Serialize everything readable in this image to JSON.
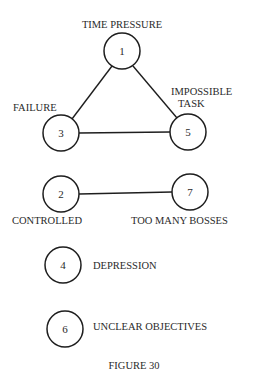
{
  "figure": {
    "caption": "FIGURE 30",
    "nodes": [
      {
        "id": "1",
        "label": "TIME PRESSURE"
      },
      {
        "id": "3",
        "label": "FAILURE"
      },
      {
        "id": "5",
        "label_line1": "IMPOSSIBLE",
        "label_line2": "TASK"
      },
      {
        "id": "2",
        "label": "CONTROLLED"
      },
      {
        "id": "7",
        "label": "TOO MANY BOSSES"
      },
      {
        "id": "4",
        "label": "DEPRESSION"
      },
      {
        "id": "6",
        "label": "UNCLEAR OBJECTIVES"
      }
    ],
    "edges": [
      {
        "from": "1",
        "to": "3"
      },
      {
        "from": "1",
        "to": "5"
      },
      {
        "from": "3",
        "to": "5"
      },
      {
        "from": "2",
        "to": "7"
      }
    ]
  }
}
